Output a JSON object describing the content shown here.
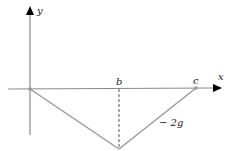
{
  "diagram": {
    "axes": {
      "x_label": "x",
      "y_label": "y"
    },
    "points": {
      "b_label": "b",
      "c_label": "c"
    },
    "slope_label": "− 2g",
    "colors": {
      "axis": "#8a8a8a",
      "graph": "#9a9a9a",
      "arrow": "#000000",
      "text": "#222222"
    }
  }
}
